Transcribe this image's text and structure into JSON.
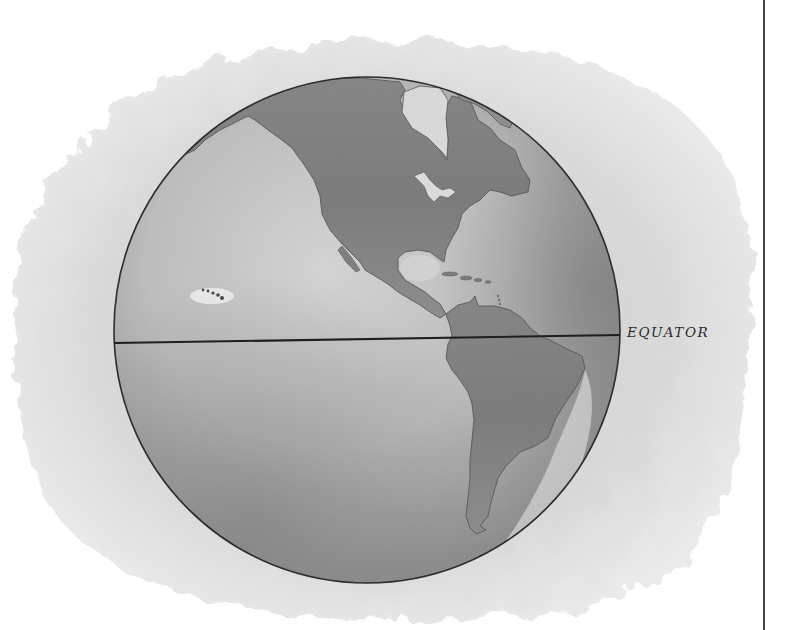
{
  "map": {
    "subject": "Western Hemisphere globe",
    "style": "monochrome watercolor",
    "labels": {
      "equator": "EQUATOR"
    },
    "features": [
      {
        "name": "North America",
        "type": "continent"
      },
      {
        "name": "South America",
        "type": "continent"
      },
      {
        "name": "Greenland",
        "type": "landmass"
      },
      {
        "name": "Hudson Bay",
        "type": "water"
      },
      {
        "name": "Great Lakes",
        "type": "water"
      },
      {
        "name": "Gulf of Mexico",
        "type": "water"
      },
      {
        "name": "Caribbean islands",
        "type": "islands"
      },
      {
        "name": "Hawaiian Islands",
        "type": "islands"
      },
      {
        "name": "Pacific Ocean",
        "type": "ocean"
      },
      {
        "name": "Atlantic Ocean",
        "type": "ocean"
      },
      {
        "name": "Equator",
        "type": "line"
      }
    ],
    "colors": {
      "background": "#ffffff",
      "wash": "#cfcfcf",
      "ocean": "#bdbdbd",
      "ocean_dark": "#8f8f8f",
      "land": "#8a8a8a",
      "land_dark": "#6b6b6b",
      "coast_highlight": "#eeeeee",
      "line": "#1e1e1e"
    }
  }
}
